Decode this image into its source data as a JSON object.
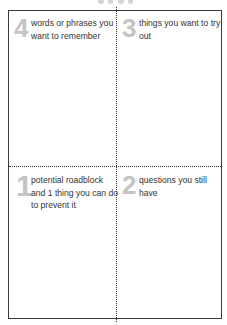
{
  "sheet": {
    "quadrants": [
      {
        "position": "top-left",
        "number": "4",
        "text": "words or phrases you want to remember"
      },
      {
        "position": "top-right",
        "number": "3",
        "text": "things you want to try out"
      },
      {
        "position": "bottom-left",
        "number": "1",
        "text": "potential roadblock and 1 thing you can do to prevent it"
      },
      {
        "position": "bottom-right",
        "number": "2",
        "text": "questions you still have"
      }
    ]
  },
  "colors": {
    "border": "#3a3a3a",
    "numeral": "#c4c4c4",
    "text": "#333333"
  }
}
